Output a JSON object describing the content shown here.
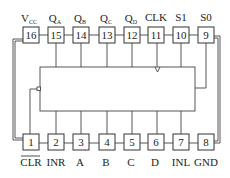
{
  "diagram": {
    "type": "ic-pinout",
    "package": "DIP-16",
    "top_pins": [
      {
        "number": "16",
        "label": "V",
        "sub": "CC"
      },
      {
        "number": "15",
        "label": "Q",
        "sub": "A"
      },
      {
        "number": "14",
        "label": "Q",
        "sub": "B"
      },
      {
        "number": "13",
        "label": "Q",
        "sub": "C"
      },
      {
        "number": "12",
        "label": "Q",
        "sub": "D"
      },
      {
        "number": "11",
        "label": "CLK",
        "sub": ""
      },
      {
        "number": "10",
        "label": "S1",
        "sub": ""
      },
      {
        "number": "9",
        "label": "S0",
        "sub": ""
      }
    ],
    "bottom_pins": [
      {
        "number": "1",
        "label": "CLR",
        "overline": true
      },
      {
        "number": "2",
        "label": "INR",
        "overline": false
      },
      {
        "number": "3",
        "label": "A",
        "overline": false
      },
      {
        "number": "4",
        "label": "B",
        "overline": false
      },
      {
        "number": "5",
        "label": "C",
        "overline": false
      },
      {
        "number": "6",
        "label": "D",
        "overline": false
      },
      {
        "number": "7",
        "label": "INL",
        "overline": false
      },
      {
        "number": "8",
        "label": "GND",
        "overline": false
      }
    ]
  }
}
